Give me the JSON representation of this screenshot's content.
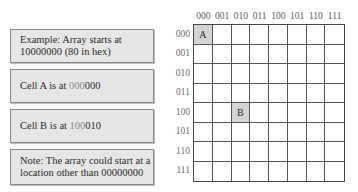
{
  "notes": [
    {
      "parts": [
        {
          "text": "Example: Array starts at 10000000 (80 in hex)",
          "lite": false
        }
      ]
    },
    {
      "parts": [
        {
          "text": "Cell A is at ",
          "lite": false
        },
        {
          "text": "000",
          "lite": true
        },
        {
          "text": "000",
          "lite": false
        }
      ]
    },
    {
      "parts": [
        {
          "text": "Cell B is at ",
          "lite": false
        },
        {
          "text": "100",
          "lite": true
        },
        {
          "text": "010",
          "lite": false
        }
      ]
    },
    {
      "parts": [
        {
          "text": "Note: The array could start at a location other than 00000000",
          "lite": false
        }
      ]
    }
  ],
  "grid": {
    "column_labels": [
      "000",
      "001",
      "010",
      "011",
      "100",
      "101",
      "110",
      "111"
    ],
    "row_labels": [
      "000",
      "001",
      "010",
      "011",
      "100",
      "101",
      "110",
      "111"
    ],
    "marked_cells": [
      {
        "row": 0,
        "col": 0,
        "label": "A"
      },
      {
        "row": 4,
        "col": 2,
        "label": "B"
      }
    ]
  }
}
